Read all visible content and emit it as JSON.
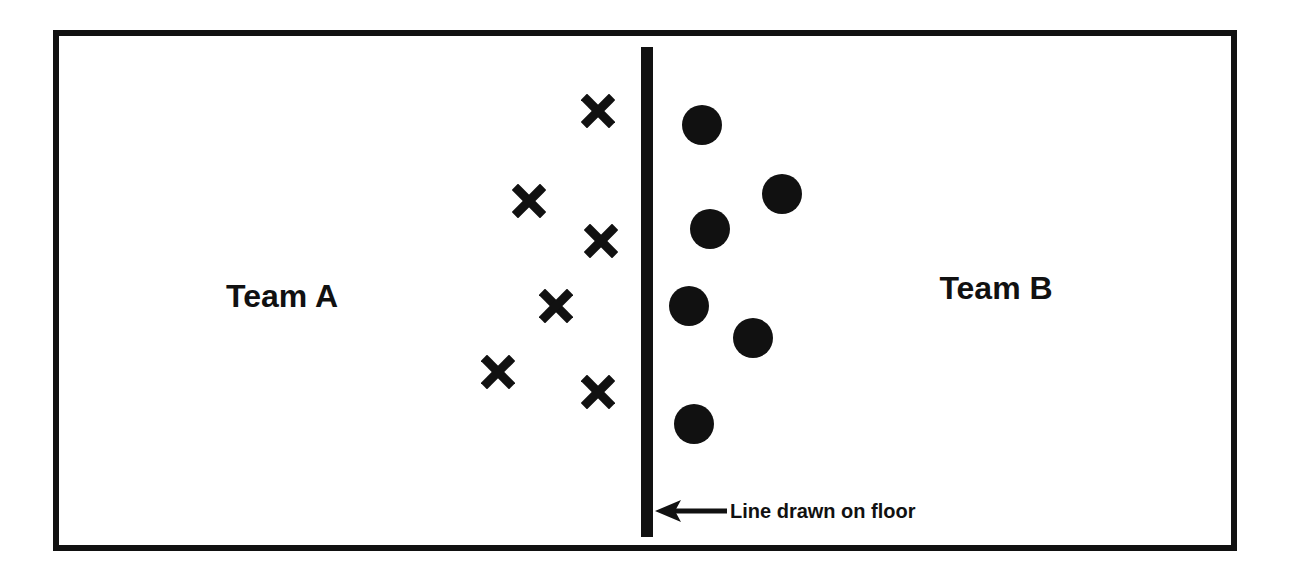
{
  "diagram": {
    "team_a": {
      "label": "Team A",
      "x": 282,
      "y": 296,
      "marker": "x-icon",
      "players": [
        {
          "x": 598,
          "y": 111
        },
        {
          "x": 529,
          "y": 201
        },
        {
          "x": 601,
          "y": 241
        },
        {
          "x": 556,
          "y": 306
        },
        {
          "x": 498,
          "y": 372
        },
        {
          "x": 598,
          "y": 392
        }
      ]
    },
    "team_b": {
      "label": "Team B",
      "x": 996,
      "y": 288,
      "marker": "circle-icon",
      "players": [
        {
          "x": 702,
          "y": 125
        },
        {
          "x": 782,
          "y": 194
        },
        {
          "x": 710,
          "y": 229
        },
        {
          "x": 689,
          "y": 306
        },
        {
          "x": 753,
          "y": 338
        },
        {
          "x": 694,
          "y": 424
        }
      ]
    },
    "line": {
      "annotation": "Line drawn on floor",
      "arrow": "left-arrow-icon"
    },
    "colors": {
      "ink": "#111111",
      "background": "#ffffff"
    }
  }
}
